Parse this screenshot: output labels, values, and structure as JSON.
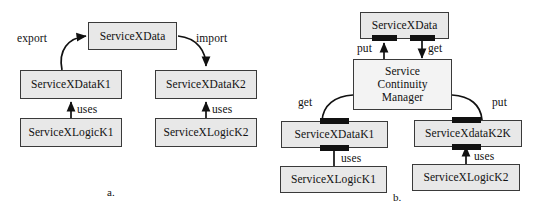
{
  "figure": {
    "panels": [
      {
        "id": "a",
        "caption": "a.",
        "nodes": [
          {
            "id": "a-servicexdata",
            "label": "ServiceXData"
          },
          {
            "id": "a-datak1",
            "label": "ServiceXDataK1"
          },
          {
            "id": "a-logick1",
            "label": "ServiceXLogicK1"
          },
          {
            "id": "a-datak2",
            "label": "ServiceXDataK2"
          },
          {
            "id": "a-logick2",
            "label": "ServiceXLogicK2"
          }
        ],
        "edges": [
          {
            "id": "a-export",
            "label": "export",
            "from": "a-datak1",
            "to": "a-servicexdata"
          },
          {
            "id": "a-import",
            "label": "import",
            "from": "a-servicexdata",
            "to": "a-datak2"
          },
          {
            "id": "a-uses-1",
            "label": "uses",
            "from": "a-logick1",
            "to": "a-datak1"
          },
          {
            "id": "a-uses-2",
            "label": "uses",
            "from": "a-logick2",
            "to": "a-datak2"
          }
        ]
      },
      {
        "id": "b",
        "caption": "b.",
        "nodes": [
          {
            "id": "b-servicexdata",
            "label": "ServiceXData"
          },
          {
            "id": "b-manager",
            "label": "Service\nContinuity\nManager"
          },
          {
            "id": "b-datak1",
            "label": "ServiceXDataK1"
          },
          {
            "id": "b-datak2k",
            "label": "ServiceXdataK2K"
          },
          {
            "id": "b-logick1",
            "label": "ServiceXLogicK1"
          },
          {
            "id": "b-logick2",
            "label": "ServiceXLogicK2"
          }
        ],
        "edges": [
          {
            "id": "b-put-top",
            "label": "put",
            "from": "b-manager",
            "to": "b-servicexdata"
          },
          {
            "id": "b-get-top",
            "label": "get",
            "from": "b-servicexdata",
            "to": "b-manager"
          },
          {
            "id": "b-get-left",
            "label": "get",
            "from": "b-manager",
            "to": "b-datak1"
          },
          {
            "id": "b-put-right",
            "label": "put",
            "from": "b-manager",
            "to": "b-datak2k"
          },
          {
            "id": "b-uses-1",
            "label": "uses",
            "from": "b-logick1",
            "to": "b-datak1"
          },
          {
            "id": "b-uses-2",
            "label": "uses",
            "from": "b-logick2",
            "to": "b-datak2k"
          }
        ]
      }
    ]
  },
  "colors": {
    "node_fill": "#e8e8e8",
    "node_stroke": "#3a3a3a",
    "port_fill": "#111111",
    "text": "#111111",
    "background": "#ffffff"
  }
}
